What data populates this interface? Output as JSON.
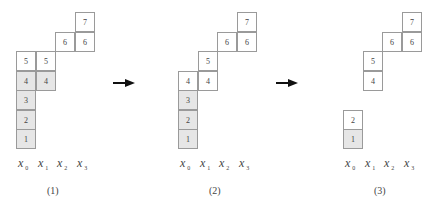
{
  "diagram": {
    "panels": [
      {
        "caption": "(1)",
        "columns": [
          "x",
          "x",
          "x",
          "x"
        ],
        "subscripts": [
          "0",
          "1",
          "2",
          "3"
        ],
        "cells": [
          {
            "label": "7",
            "col": 3,
            "row": 7,
            "shaded": false
          },
          {
            "label": "6",
            "col": 2,
            "row": 6,
            "shaded": false
          },
          {
            "label": "6",
            "col": 3,
            "row": 6,
            "shaded": false
          },
          {
            "label": "5",
            "col": 0,
            "row": 5,
            "shaded": false
          },
          {
            "label": "5",
            "col": 1,
            "row": 5,
            "shaded": false
          },
          {
            "label": "4",
            "col": 0,
            "row": 4,
            "shaded": true
          },
          {
            "label": "4",
            "col": 1,
            "row": 4,
            "shaded": true
          },
          {
            "label": "3",
            "col": 0,
            "row": 3,
            "shaded": true
          },
          {
            "label": "2",
            "col": 0,
            "row": 2,
            "shaded": true
          },
          {
            "label": "1",
            "col": 0,
            "row": 1,
            "shaded": true
          }
        ]
      },
      {
        "caption": "(2)",
        "columns": [
          "x",
          "x",
          "x",
          "x"
        ],
        "subscripts": [
          "0",
          "1",
          "2",
          "3"
        ],
        "cells": [
          {
            "label": "7",
            "col": 3,
            "row": 7,
            "shaded": false
          },
          {
            "label": "6",
            "col": 2,
            "row": 6,
            "shaded": false
          },
          {
            "label": "6",
            "col": 3,
            "row": 6,
            "shaded": false
          },
          {
            "label": "5",
            "col": 1,
            "row": 5,
            "shaded": false
          },
          {
            "label": "4",
            "col": 0,
            "row": 4,
            "shaded": false
          },
          {
            "label": "4",
            "col": 1,
            "row": 4,
            "shaded": false
          },
          {
            "label": "3",
            "col": 0,
            "row": 3,
            "shaded": true
          },
          {
            "label": "2",
            "col": 0,
            "row": 2,
            "shaded": true
          },
          {
            "label": "1",
            "col": 0,
            "row": 1,
            "shaded": true
          }
        ]
      },
      {
        "caption": "(3)",
        "columns": [
          "x",
          "x",
          "x",
          "x"
        ],
        "subscripts": [
          "0",
          "1",
          "2",
          "3"
        ],
        "cells": [
          {
            "label": "7",
            "col": 3,
            "row": 7,
            "shaded": false
          },
          {
            "label": "6",
            "col": 2,
            "row": 6,
            "shaded": false
          },
          {
            "label": "6",
            "col": 3,
            "row": 6,
            "shaded": false
          },
          {
            "label": "5",
            "col": 1,
            "row": 5,
            "shaded": false
          },
          {
            "label": "4",
            "col": 1,
            "row": 4,
            "shaded": false
          },
          {
            "label": "2",
            "col": 0,
            "row": 2,
            "shaded": false
          },
          {
            "label": "1",
            "col": 0,
            "row": 1,
            "shaded": true
          }
        ]
      }
    ],
    "arrows": [
      {
        "name": "arrow-1-to-2",
        "direction": "right"
      },
      {
        "name": "arrow-2-to-3",
        "direction": "right"
      }
    ],
    "colors": {
      "shaded_fill": "#e6e6e6",
      "cell_border": "#9a9a9a",
      "arrow": "#111111"
    }
  }
}
